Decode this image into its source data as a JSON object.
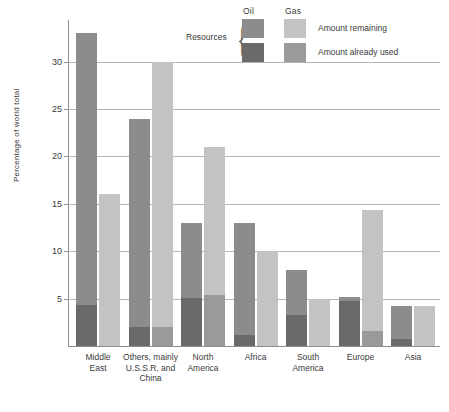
{
  "legend": {
    "group_label": "Resources",
    "col_oil": "Oil",
    "col_gas": "Gas",
    "row_remaining": "Amount remaining",
    "row_used": "Amount already used"
  },
  "colors": {
    "oil_remaining": "#8c8c8c",
    "oil_used": "#6a6a6a",
    "gas_remaining": "#c3c3c3",
    "gas_used": "#9a9a9a",
    "gridline": "#b4b4b4",
    "axis": "#8f8f8f",
    "text": "#3a3a3a"
  },
  "chart_data": {
    "type": "bar",
    "title": "",
    "xlabel": "",
    "ylabel": "Percentage of world total",
    "ylim": [
      0,
      34.5
    ],
    "yticks": [
      5,
      10,
      15,
      20,
      25,
      30
    ],
    "ytick_labels": [
      "5",
      "10",
      "15",
      "20",
      "25",
      "30"
    ],
    "grid": true,
    "legend_position": "top-right",
    "categories": [
      "Middle East",
      "Others, mainly U.S.S.R. and China",
      "North America",
      "Africa",
      "South America",
      "Europe",
      "Asia"
    ],
    "category_label_lines": [
      [
        "Middle",
        "East"
      ],
      [
        "Others, mainly",
        "U.S.S.R. and",
        "China"
      ],
      [
        "North",
        "America"
      ],
      [
        "Africa"
      ],
      [
        "South",
        "America"
      ],
      [
        "Europe"
      ],
      [
        "Asia"
      ]
    ],
    "series": [
      {
        "name": "Oil — Amount remaining",
        "resource": "Oil",
        "part": "remaining",
        "values": [
          28.7,
          22.0,
          7.9,
          11.8,
          4.7,
          0.4,
          3.5
        ]
      },
      {
        "name": "Oil — Amount already used",
        "resource": "Oil",
        "part": "used",
        "values": [
          4.3,
          2.0,
          5.1,
          1.2,
          3.3,
          4.8,
          0.7
        ]
      },
      {
        "name": "Gas — Amount remaining",
        "resource": "Gas",
        "part": "remaining",
        "values": [
          16.0,
          28.0,
          15.6,
          10.0,
          5.0,
          12.7,
          4.2
        ]
      },
      {
        "name": "Gas — Amount already used",
        "resource": "Gas",
        "part": "used",
        "values": [
          0.0,
          2.0,
          5.4,
          0.0,
          0.0,
          1.6,
          0.0
        ]
      }
    ],
    "totals": {
      "oil": [
        33.0,
        24.0,
        13.0,
        13.0,
        8.0,
        5.2,
        4.2
      ],
      "gas": [
        16.0,
        30.0,
        21.0,
        10.0,
        5.0,
        14.3,
        4.2
      ]
    }
  }
}
